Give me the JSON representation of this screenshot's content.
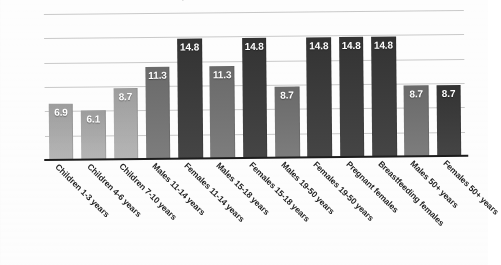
{
  "chart_data": {
    "type": "bar",
    "title": "",
    "xlabel": "",
    "ylabel": "",
    "ylim": [
      0,
      18
    ],
    "grid": true,
    "gridline_count": 6,
    "legend": "none",
    "categories": [
      "Children 1-3 years",
      "Children 4-6 years",
      "Children 7-10 years",
      "Males 11-14 years",
      "Females 11-14 years",
      "Males 15-18 years",
      "Females 15-18 years",
      "Males 19-50 years",
      "Females 19-50 years",
      "Pregnant females",
      "Breastfeeding females",
      "Males 50+ years",
      "Females 50+ years"
    ],
    "values": [
      6.9,
      6.1,
      8.7,
      11.3,
      14.8,
      11.3,
      14.8,
      8.7,
      14.8,
      14.8,
      14.8,
      8.7,
      8.7
    ],
    "value_labels": [
      "6.9",
      "6.1",
      "8.7",
      "11.3",
      "14.8",
      "11.3",
      "14.8",
      "8.7",
      "14.8",
      "14.8",
      "14.8",
      "8.7",
      "8.7"
    ],
    "bar_shades": [
      "light",
      "light",
      "light",
      "mid",
      "dark",
      "mid",
      "dark",
      "mid",
      "dark",
      "dark",
      "dark",
      "mid",
      "dark"
    ],
    "colors": {
      "light": "#a8a8a8",
      "mid": "#727272",
      "dark": "#3b3b3b",
      "gridline": "#c9c9c9",
      "axis": "#1c1c1c",
      "value_text": "#ffffff",
      "label_text": "#1f1f1f",
      "background": "#ffffff"
    }
  },
  "figure": {
    "clipped_title": "Recommended Daily Intake"
  }
}
